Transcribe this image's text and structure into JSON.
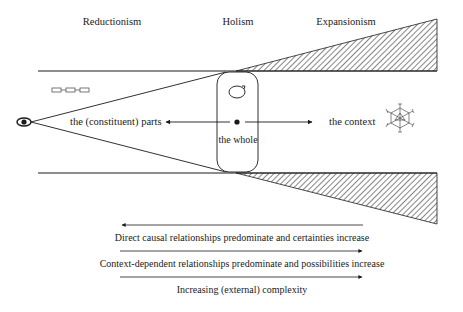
{
  "headers": {
    "reductionism": "Reductionism",
    "holism": "Holism",
    "expansionism": "Expansionism"
  },
  "labels": {
    "parts": "the (constituent) parts",
    "whole": "the whole",
    "context": "the context"
  },
  "icons": {
    "observer": "eye-icon",
    "parts": "linked-boxes-icon",
    "whole": "circular-arrow-icon",
    "context": "network-polyhedron-icon"
  },
  "bottom_notes": [
    {
      "text": "Direct causal relationships predominate and certainties increase",
      "arrow_direction": "left"
    },
    {
      "text": "Context-dependent relationships predominate and possibilities increase",
      "arrow_direction": "right"
    },
    {
      "text": "Increasing (external) complexity",
      "arrow_direction": "right"
    }
  ],
  "colors": {
    "line": "#1a1a1a",
    "hatch": "#333333",
    "background": "#ffffff"
  }
}
